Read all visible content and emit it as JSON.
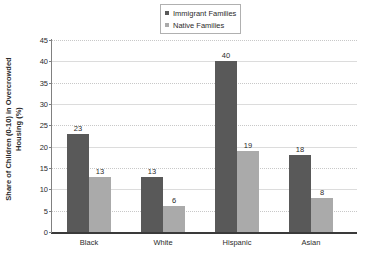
{
  "chart_data": {
    "type": "bar",
    "title": "",
    "xlabel": "",
    "ylabel": "Share of Children (0-10) in Overcrowded Housing (%)",
    "ylabel_line1": "Share of Children (0-10) in Overcrowded",
    "ylabel_line2": "Housing (%)",
    "categories": [
      "Black",
      "White",
      "Hispanic",
      "Asian"
    ],
    "series": [
      {
        "name": "Immigrant Families",
        "color": "#595959",
        "values": [
          23,
          13,
          40,
          18
        ]
      },
      {
        "name": "Native Families",
        "color": "#aaaaaa",
        "values": [
          13,
          6,
          19,
          8
        ]
      }
    ],
    "ylim": [
      0,
      45
    ],
    "ytick_step": 5,
    "yticks": [
      0,
      5,
      10,
      15,
      20,
      25,
      30,
      35,
      40,
      45
    ],
    "ytick_labels": [
      "0",
      "5",
      "10",
      "15",
      "20",
      "25",
      "30",
      "35",
      "40",
      "45"
    ],
    "grid": true,
    "grid_axis": "y",
    "legend_position": "top-center",
    "data_labels": true
  },
  "legend": {
    "items": [
      {
        "label": "Immigrant Families",
        "color": "#595959",
        "marker": "square-marker"
      },
      {
        "label": "Native Families",
        "color": "#aaaaaa",
        "marker": "square-marker"
      }
    ]
  },
  "colors": {
    "immigrant": "#595959",
    "native": "#aaaaaa",
    "axis": "#808080",
    "baseline": "#3a3a3a",
    "gridline": "#c8c8c8",
    "text": "#2b2b2b",
    "background": "#ffffff"
  }
}
